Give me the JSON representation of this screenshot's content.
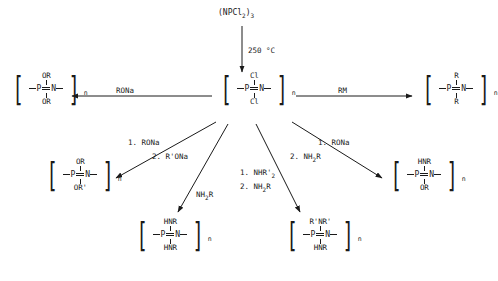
{
  "diagram": {
    "reactant": {
      "formula_main": "(NPCl",
      "formula_sub1": "2",
      "formula_mid": ")",
      "formula_sub2": "3"
    },
    "conditions": {
      "thermal": "250 °C"
    },
    "structures": {
      "center": {
        "top": "Cl",
        "bottom": "Cl",
        "left_atom": "P",
        "right_atom": "N",
        "repeat": "n"
      },
      "left": {
        "top": "OR",
        "bottom": "OR",
        "left_atom": "P",
        "right_atom": "N",
        "repeat": "n"
      },
      "right": {
        "top": "R",
        "bottom": "R",
        "left_atom": "P",
        "right_atom": "N",
        "repeat": "n"
      },
      "mid_left": {
        "top": "OR",
        "bottom": "OR'",
        "left_atom": "P",
        "right_atom": "N",
        "repeat": "n"
      },
      "mid_right": {
        "top": "HNR",
        "bottom": "OR",
        "left_atom": "P",
        "right_atom": "N",
        "repeat": "n"
      },
      "bottom_left": {
        "top": "HNR",
        "bottom": "HNR",
        "left_atom": "P",
        "right_atom": "N",
        "repeat": "n"
      },
      "bottom_right": {
        "top": "R'NR'",
        "bottom": "HNR",
        "left_atom": "P",
        "right_atom": "N",
        "repeat": "n"
      }
    },
    "reagents": {
      "arrow_left": "RONa",
      "arrow_right": "RM",
      "branch_mid_left_step1": "1. RONa",
      "branch_mid_left_step2": "2. R'ONa",
      "branch_bottom_left": "NH2R",
      "branch_bottom_left_sub": "2",
      "branch_bottom_center_step1": "1. NHR'",
      "branch_bottom_center_step1_sub": "2",
      "branch_bottom_center_step2": "2. NH2R",
      "branch_bottom_center_step2_sub": "2",
      "branch_mid_right_step1": "1. RONa",
      "branch_mid_right_step2": "2. NH2R",
      "branch_mid_right_step2_sub": "2"
    }
  }
}
